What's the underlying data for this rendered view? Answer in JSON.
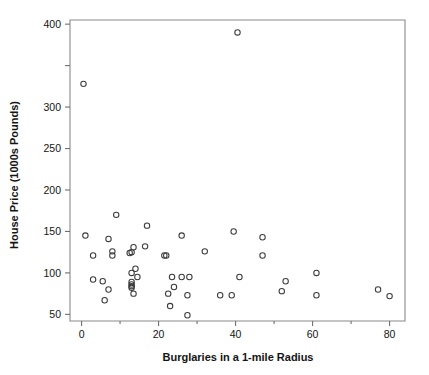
{
  "chart_data": {
    "type": "scatter",
    "title": "",
    "xlabel": "Burglaries in a 1-mile Radius",
    "ylabel": "House Price (1000s Pounds)",
    "xlim": [
      -3,
      84
    ],
    "ylim": [
      42,
      405
    ],
    "grid": false,
    "legend": null,
    "marker": "open-circle",
    "xticks": [
      0,
      20,
      40,
      60,
      80
    ],
    "xtick_labels": [
      "0",
      "20",
      "40",
      "60",
      "80"
    ],
    "x_minor_ticks": [
      10,
      30,
      50,
      70
    ],
    "yticks": [
      50,
      100,
      150,
      200,
      250,
      300,
      350,
      400
    ],
    "ytick_labels": [
      "50",
      "100",
      "150",
      "200",
      "250",
      "300",
      "",
      "400"
    ],
    "points": [
      {
        "x": 0.5,
        "y": 328
      },
      {
        "x": 40.5,
        "y": 390
      },
      {
        "x": 1.0,
        "y": 145
      },
      {
        "x": 3.0,
        "y": 121
      },
      {
        "x": 3.0,
        "y": 92
      },
      {
        "x": 5.5,
        "y": 90
      },
      {
        "x": 6.0,
        "y": 67
      },
      {
        "x": 7.0,
        "y": 141
      },
      {
        "x": 7.0,
        "y": 80
      },
      {
        "x": 8.0,
        "y": 126
      },
      {
        "x": 8.0,
        "y": 121
      },
      {
        "x": 9.0,
        "y": 170
      },
      {
        "x": 12.5,
        "y": 124
      },
      {
        "x": 13.0,
        "y": 125
      },
      {
        "x": 13.0,
        "y": 100
      },
      {
        "x": 13.0,
        "y": 89
      },
      {
        "x": 13.0,
        "y": 86
      },
      {
        "x": 13.0,
        "y": 84
      },
      {
        "x": 13.0,
        "y": 82
      },
      {
        "x": 13.5,
        "y": 131
      },
      {
        "x": 13.5,
        "y": 75
      },
      {
        "x": 14.0,
        "y": 105
      },
      {
        "x": 14.5,
        "y": 95
      },
      {
        "x": 16.5,
        "y": 132
      },
      {
        "x": 17.0,
        "y": 157
      },
      {
        "x": 21.5,
        "y": 121
      },
      {
        "x": 22.0,
        "y": 121
      },
      {
        "x": 22.5,
        "y": 75
      },
      {
        "x": 23.0,
        "y": 60
      },
      {
        "x": 23.5,
        "y": 95
      },
      {
        "x": 24.0,
        "y": 83
      },
      {
        "x": 26.0,
        "y": 145
      },
      {
        "x": 26.0,
        "y": 95
      },
      {
        "x": 27.5,
        "y": 73
      },
      {
        "x": 27.5,
        "y": 49
      },
      {
        "x": 28.0,
        "y": 95
      },
      {
        "x": 32.0,
        "y": 126
      },
      {
        "x": 36.0,
        "y": 73
      },
      {
        "x": 39.0,
        "y": 73
      },
      {
        "x": 39.5,
        "y": 150
      },
      {
        "x": 41.0,
        "y": 95
      },
      {
        "x": 47.0,
        "y": 143
      },
      {
        "x": 47.0,
        "y": 121
      },
      {
        "x": 52.0,
        "y": 78
      },
      {
        "x": 53.0,
        "y": 90
      },
      {
        "x": 61.0,
        "y": 100
      },
      {
        "x": 61.0,
        "y": 73
      },
      {
        "x": 77.0,
        "y": 80
      },
      {
        "x": 80.0,
        "y": 72
      }
    ]
  },
  "labels": {
    "x_axis_title": "Burglaries in a 1-mile Radius",
    "y_axis_title": "House Price (1000s Pounds)"
  },
  "colors": {
    "background": "#ffffff",
    "frame": "#8a8a8a",
    "marker_stroke": "#3b3b3b",
    "text": "#141414"
  }
}
